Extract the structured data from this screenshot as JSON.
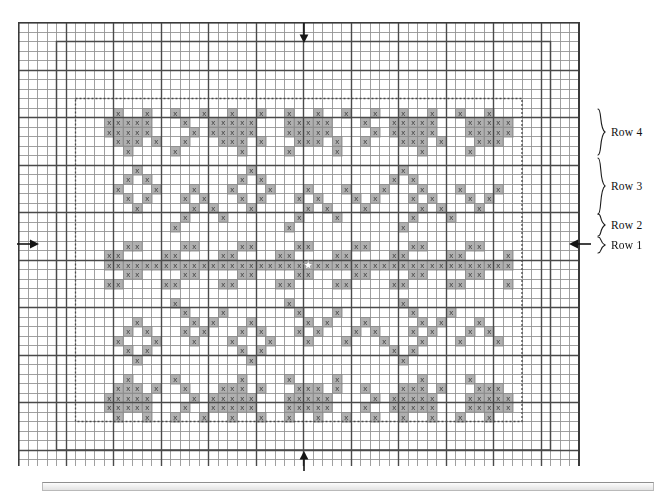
{
  "chart_data": {
    "type": "heatmap",
    "title": "",
    "xlabel": "",
    "ylabel": "",
    "grid": {
      "columns": 59,
      "rows": 47,
      "cell_px": 9.5,
      "minor_grid": true,
      "major_every": 5,
      "minor_color": "#b8b8b8",
      "major_color": "#4a4a4a",
      "border_color": "#3a3a3a",
      "symbol_cell_fill": "#b0b0b0",
      "symbol_glyph": "x",
      "symbol_color": "#3c3c3c"
    },
    "inner_outline": {
      "label": "solid inner rectangle",
      "x0": 4,
      "y0": 2,
      "x1": 56,
      "y1": 45,
      "color": "#4a4a4a"
    },
    "dotted_outline": {
      "label": "dotted inner rectangle",
      "x0": 6,
      "y0": 8,
      "x1": 53,
      "y1": 42,
      "color": "#4a4a4a"
    },
    "pattern_origin": {
      "col": 9,
      "row": 9
    },
    "pattern_width": 42,
    "pattern_rows": [
      "0100100100100100100100100100100100100100100",
      "1111100010011111000111110001001111100011111",
      "1111100001011111000111110000101111100011111",
      "0111010010001110100011101001000111010001110",
      "0010000100000010000100001000000001000010000",
      "0000000000000000000000000000000000000000000",
      "0001000000000001000000000000000100000000000",
      "0010100000000010100000000000001010000000000",
      "0100010001000100010001000100010001000100010",
      "0010100010100010100010100010100010100010100",
      "0001000001010001000001010001000001010001000",
      "0000000010001000000010001000000010001000000",
      "0000000100000000000100000000000100000000000",
      "0000000000000000000000000000000000000000000",
      "0011000011000011000011000011000011000011000",
      "1100001100001100001100001100001100001100001",
      "1111111111111111111111111111111111111111111",
      "0011000011000011000011000011000011000011000",
      "1100001100001100001100001100001100001100001",
      "0000000000000000000000000000000000000000000",
      "0000000100000000000100000000000100000000000",
      "0000000010001000000010001000000010001000000",
      "0001000001010001000001010001000001010001000",
      "0010100010100010100010100010100010100010100",
      "0100010001000100010001000100010001000100010",
      "0010100000000010100000000000001010000000000",
      "0001000000000001000000000000000100000000000",
      "0000000000000000000000000000000000000000000",
      "0010000100000010000100001000000001000010000",
      "0111010010001110100011101001000111010001110",
      "1111100001011111000111110000101111100011111",
      "1111100010011111000111110001001111100011111",
      "0100100100100100100100100100100100100100100"
    ],
    "row_markers": [
      {
        "label": "Row 4",
        "span_rows": 4,
        "brace_height": 48
      },
      {
        "label": "Row 3",
        "span_rows": 5,
        "brace_height": 58
      },
      {
        "label": "Row 2",
        "span_rows": 2,
        "brace_height": 22
      },
      {
        "label": "Row 1",
        "span_rows": 1,
        "brace_height": 16
      }
    ]
  },
  "annotations": {
    "arrow_top": {
      "name": "start-direction-arrow-top",
      "direction": "down"
    },
    "arrow_bottom": {
      "name": "start-direction-arrow-bottom",
      "direction": "up"
    },
    "arrow_left": {
      "name": "start-direction-arrow-left",
      "direction": "right"
    },
    "arrow_right": {
      "name": "start-direction-arrow-right",
      "direction": "left"
    }
  },
  "row_labels": {
    "row4": "Row 4",
    "row3": "Row 3",
    "row2": "Row 2",
    "row1": "Row 1"
  }
}
